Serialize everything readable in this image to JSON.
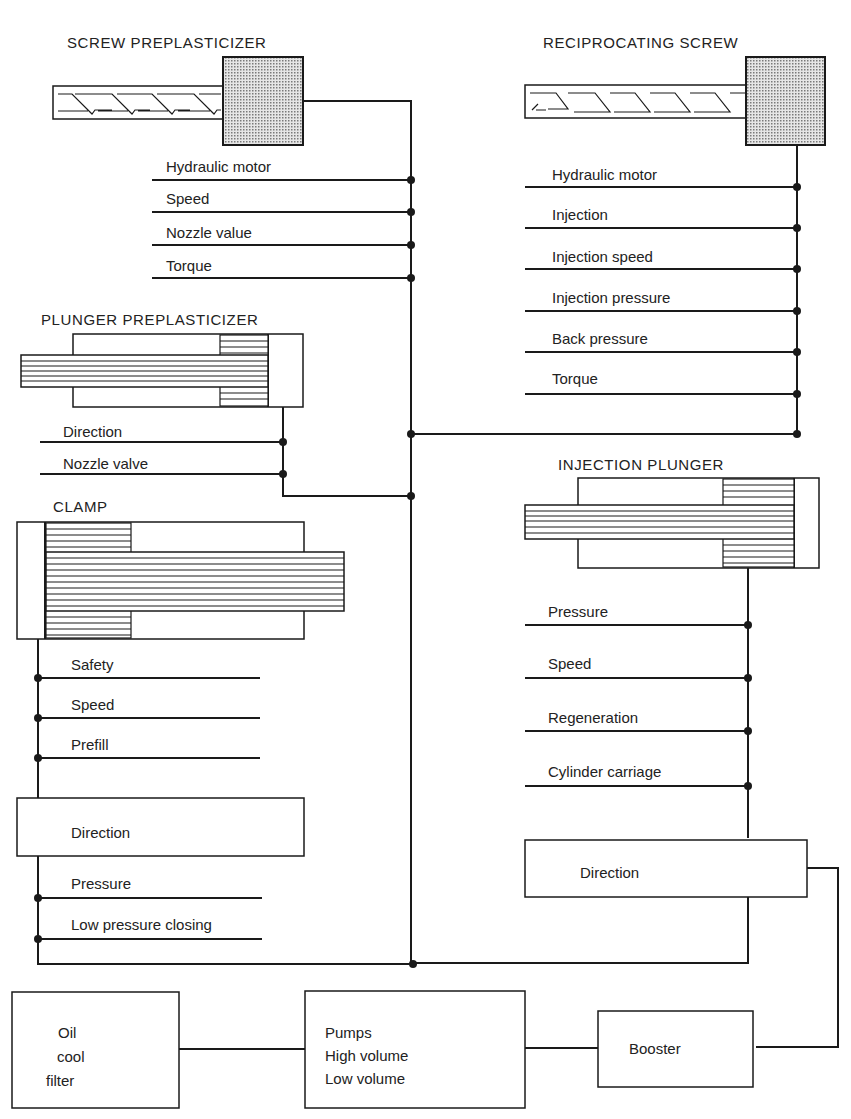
{
  "diagram": {
    "colors": {
      "line": "#1a1a1a",
      "motor_fill": "#bdbdbd",
      "background": "#ffffff"
    },
    "screw_preplasticizer": {
      "title": "SCREW PREPLASTICIZER",
      "controls": [
        "Hydraulic motor",
        "Speed",
        "Nozzle value",
        "Torque"
      ]
    },
    "reciprocating_screw": {
      "title": "RECIPROCATING SCREW",
      "controls": [
        "Hydraulic motor",
        "Injection",
        "Injection speed",
        "Injection pressure",
        "Back pressure",
        "Torque"
      ]
    },
    "plunger_preplasticizer": {
      "title": "PLUNGER PREPLASTICIZER",
      "controls": [
        "Direction",
        "Nozzle valve"
      ]
    },
    "clamp": {
      "title": "CLAMP",
      "controls": [
        "Safety",
        "Speed",
        "Prefill"
      ],
      "direction_box": "Direction",
      "controls_after": [
        "Pressure",
        "Low pressure closing"
      ]
    },
    "injection_plunger": {
      "title": "INJECTION PLUNGER",
      "controls": [
        "Pressure",
        "Speed",
        "Regeneration",
        "Cylinder carriage"
      ],
      "direction_box": "Direction"
    },
    "power_unit": {
      "oil": [
        "Oil",
        "cool",
        "filter"
      ],
      "pumps": [
        "Pumps",
        "High volume",
        "Low volume"
      ],
      "booster": "Booster"
    }
  }
}
